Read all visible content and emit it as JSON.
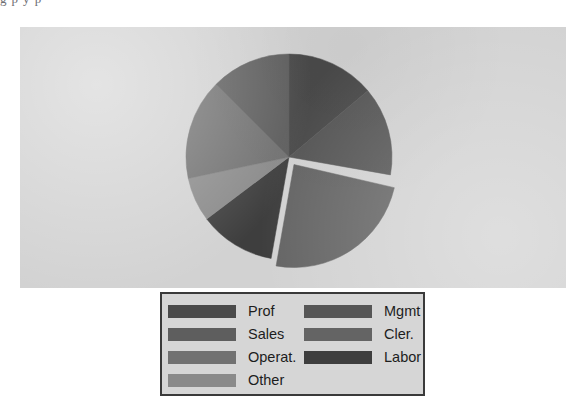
{
  "page": {
    "clipped_header_text": "g p y p",
    "background_color": "#ffffff"
  },
  "panel": {
    "background_color": "#d2d2d2"
  },
  "legend": {
    "border_color": "#3a3a3a",
    "background_color": "#d6d6d6",
    "left_column": [
      {
        "label": "Prof",
        "color": "#4a4a4a"
      },
      {
        "label": "Sales",
        "color": "#5e5e5e"
      },
      {
        "label": "Operat.",
        "color": "#717171"
      },
      {
        "label": "Other",
        "color": "#8a8a8a"
      }
    ],
    "right_column": [
      {
        "label": "Mgmt",
        "color": "#565656"
      },
      {
        "label": "Cler.",
        "color": "#646464"
      },
      {
        "label": "Labor",
        "color": "#3e3e3e"
      }
    ]
  },
  "chart_data": {
    "type": "pie",
    "title": "",
    "legend_position": "bottom",
    "start_angle_deg": 0,
    "direction": "clockwise",
    "center": {
      "x": 289,
      "y": 157
    },
    "radius": 103,
    "categories": [
      "Prof",
      "Mgmt",
      "Cler.",
      "Labor",
      "Other",
      "Operat.",
      "Sales"
    ],
    "values": [
      14,
      14,
      24,
      12,
      7,
      16,
      13
    ],
    "slices": [
      {
        "label": "Prof",
        "value": 14,
        "color": "#4a4a4a",
        "start_deg": 0,
        "end_deg": 50,
        "exploded": false
      },
      {
        "label": "Mgmt",
        "value": 14,
        "color": "#565656",
        "start_deg": 50,
        "end_deg": 100,
        "exploded": false
      },
      {
        "label": "Cler.",
        "value": 24,
        "color": "#646464",
        "start_deg": 103,
        "end_deg": 190,
        "exploded": true
      },
      {
        "label": "Labor",
        "value": 12,
        "color": "#3e3e3e",
        "start_deg": 190,
        "end_deg": 233,
        "exploded": false
      },
      {
        "label": "Other",
        "value": 7,
        "color": "#8a8a8a",
        "start_deg": 233,
        "end_deg": 258,
        "exploded": false
      },
      {
        "label": "Operat.",
        "value": 16,
        "color": "#717171",
        "start_deg": 258,
        "end_deg": 315,
        "exploded": false
      },
      {
        "label": "Sales",
        "value": 13,
        "color": "#5e5e5e",
        "start_deg": 315,
        "end_deg": 360,
        "exploded": false
      }
    ]
  }
}
